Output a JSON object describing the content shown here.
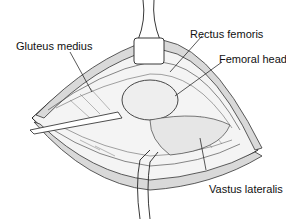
{
  "figure": {
    "labels": {
      "gluteus_medius": "Gluteus medius",
      "rectus_femoris": "Rectus femoris",
      "femoral_head": "Femoral head",
      "vastus_lateralis": "Vastus lateralis"
    },
    "colors": {
      "ink": "#111111",
      "background": "#ffffff",
      "tissue_shade": "#b8b8b8"
    }
  }
}
